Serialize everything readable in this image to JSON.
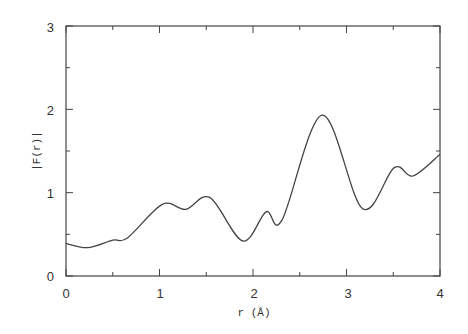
{
  "chart_data": {
    "type": "line",
    "title": "",
    "xlabel": "r (Å)",
    "ylabel": "|F(r)|",
    "xlim": [
      0,
      4
    ],
    "ylim": [
      0,
      3
    ],
    "x_ticks": [
      "0",
      "1",
      "2",
      "3",
      "4"
    ],
    "y_ticks": [
      "0",
      "1",
      "2",
      "3"
    ],
    "grid": false,
    "legend": null,
    "series": [
      {
        "name": "|F(r)|",
        "x": [
          0.0,
          0.23,
          0.5,
          0.66,
          1.03,
          1.28,
          1.54,
          1.89,
          2.14,
          2.31,
          2.74,
          3.17,
          3.51,
          3.71,
          4.0
        ],
        "values": [
          0.39,
          0.34,
          0.43,
          0.46,
          0.86,
          0.8,
          0.94,
          0.42,
          0.77,
          0.67,
          1.93,
          0.81,
          1.3,
          1.2,
          1.46
        ]
      }
    ]
  },
  "labels": {
    "x0": "0",
    "x1": "1",
    "x2": "2",
    "x3": "3",
    "x4": "4",
    "y0": "0",
    "y1": "1",
    "y2": "2",
    "y3": "3",
    "xlabel": "r (Å)",
    "ylabel": "|F(r)|"
  }
}
